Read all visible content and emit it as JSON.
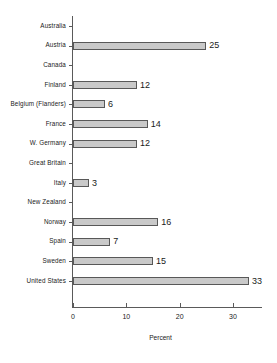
{
  "chart_data": {
    "type": "bar",
    "orientation": "horizontal",
    "title": "",
    "xlabel": "Percent",
    "ylabel": "",
    "xlim": [
      0,
      35.5
    ],
    "xticks": [
      0,
      10,
      20,
      30
    ],
    "xtick_labels": [
      "0",
      "10",
      "20",
      "30"
    ],
    "grid": false,
    "legend": null,
    "categories": [
      "Australia",
      "Austria",
      "Canada",
      "Finland",
      "Belgium (Flanders)",
      "France",
      "W. Germany",
      "Great Britain",
      "Italy",
      "New Zealand",
      "Norway",
      "Spain",
      "Sweden",
      "United States"
    ],
    "values": [
      0,
      25,
      0,
      12,
      6,
      14,
      12,
      0,
      3,
      0,
      16,
      7,
      15,
      33
    ],
    "value_labels": [
      "",
      "25",
      "",
      "12",
      "6",
      "14",
      "12",
      "",
      "3",
      "",
      "16",
      "7",
      "15",
      "33"
    ],
    "colors": {
      "bar_fill": "#c9c9c9",
      "bar_border": "#585858",
      "axis": "#5a5a5a",
      "text": "#1a1a1a",
      "background": "#ffffff"
    }
  }
}
